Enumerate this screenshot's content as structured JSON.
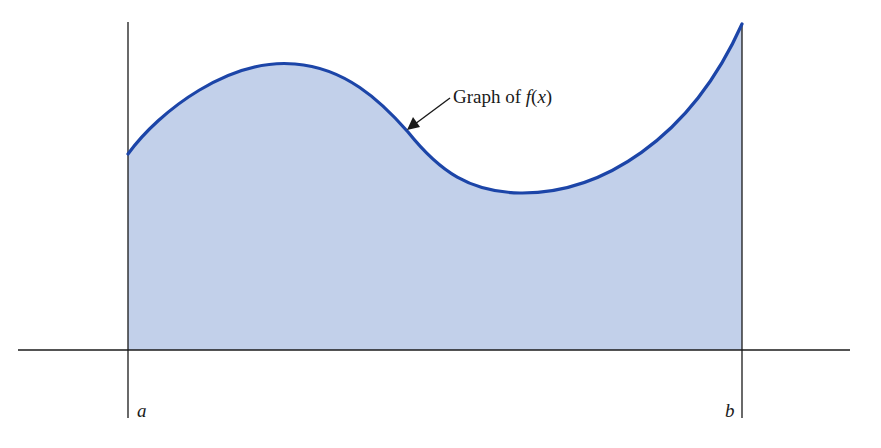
{
  "diagram": {
    "curve_label_prefix": "Graph of ",
    "curve_label_func": "f",
    "curve_label_open": "(",
    "curve_label_var": "x",
    "curve_label_close": ")",
    "left_endpoint": "a",
    "right_endpoint": "b",
    "colors": {
      "fill": "#c2d0ea",
      "curve": "#1c45a8",
      "axis": "#1a1a1a"
    }
  }
}
